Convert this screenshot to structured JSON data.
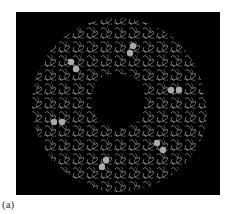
{
  "figure": {
    "label": "(a)",
    "background_color": "#000000",
    "trace_color": "#d8d8d8",
    "sphere_color": "#b0b0b0"
  }
}
